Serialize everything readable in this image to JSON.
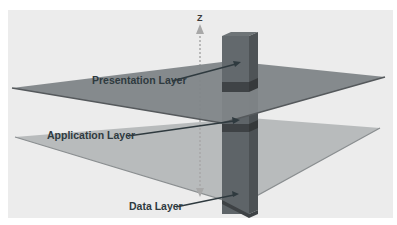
{
  "diagram": {
    "type": "layered-architecture-3d",
    "axis": {
      "label": "Z",
      "color": "#a0a0a0"
    },
    "layers": [
      {
        "name": "Presentation Layer",
        "color": "#7e8487"
      },
      {
        "name": "Application Layer",
        "color": "#b7babb"
      },
      {
        "name": "Data Layer",
        "color": "#5b6165"
      }
    ],
    "column": {
      "front_color": "#5e6468",
      "side_color": "#4a4f52",
      "band_color": "#3b3f42"
    },
    "background": "#ececec"
  }
}
